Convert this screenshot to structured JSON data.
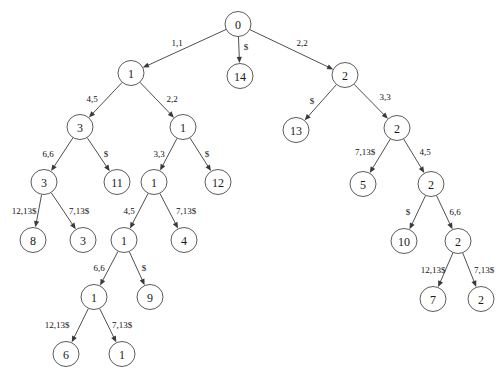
{
  "diagram": {
    "node_radius": 13,
    "colors": {
      "stroke": "#4a4a4a",
      "edge": "#3a3a3a",
      "text": "#1a1a1a",
      "background": "#ffffff"
    },
    "nodes": [
      {
        "id": "n0",
        "label": "0",
        "x": 238,
        "y": 24
      },
      {
        "id": "n1",
        "label": "14",
        "x": 240,
        "y": 76
      },
      {
        "id": "n2",
        "label": "1",
        "x": 131,
        "y": 73
      },
      {
        "id": "n3",
        "label": "2",
        "x": 345,
        "y": 75
      },
      {
        "id": "n4",
        "label": "3",
        "x": 80,
        "y": 127
      },
      {
        "id": "n5",
        "label": "1",
        "x": 183,
        "y": 127
      },
      {
        "id": "n6",
        "label": "13",
        "x": 296,
        "y": 130
      },
      {
        "id": "n7",
        "label": "2",
        "x": 397,
        "y": 128
      },
      {
        "id": "n8",
        "label": "3",
        "x": 44,
        "y": 182
      },
      {
        "id": "n9",
        "label": "11",
        "x": 117,
        "y": 182
      },
      {
        "id": "n10",
        "label": "1",
        "x": 154,
        "y": 182
      },
      {
        "id": "n11",
        "label": "12",
        "x": 218,
        "y": 182
      },
      {
        "id": "n12",
        "label": "5",
        "x": 363,
        "y": 184
      },
      {
        "id": "n13",
        "label": "2",
        "x": 431,
        "y": 184
      },
      {
        "id": "n14",
        "label": "8",
        "x": 33,
        "y": 240
      },
      {
        "id": "n15",
        "label": "3",
        "x": 83,
        "y": 240
      },
      {
        "id": "n16",
        "label": "1",
        "x": 124,
        "y": 240
      },
      {
        "id": "n17",
        "label": "4",
        "x": 184,
        "y": 240
      },
      {
        "id": "n18",
        "label": "10",
        "x": 404,
        "y": 241
      },
      {
        "id": "n19",
        "label": "2",
        "x": 458,
        "y": 241
      },
      {
        "id": "n20",
        "label": "1",
        "x": 94,
        "y": 297
      },
      {
        "id": "n21",
        "label": "9",
        "x": 150,
        "y": 297
      },
      {
        "id": "n22",
        "label": "7",
        "x": 433,
        "y": 299
      },
      {
        "id": "n23",
        "label": "2",
        "x": 481,
        "y": 299
      },
      {
        "id": "n24",
        "label": "6",
        "x": 66,
        "y": 354
      },
      {
        "id": "n25",
        "label": "1",
        "x": 122,
        "y": 354
      }
    ],
    "edges": [
      {
        "from": "n0",
        "to": "n2",
        "label": "1,1",
        "lx": 177,
        "ly": 43
      },
      {
        "from": "n0",
        "to": "n1",
        "label": "$",
        "lx": 246,
        "ly": 47
      },
      {
        "from": "n0",
        "to": "n3",
        "label": "2,2",
        "lx": 302,
        "ly": 43
      },
      {
        "from": "n2",
        "to": "n4",
        "label": "4,5",
        "lx": 92,
        "ly": 99
      },
      {
        "from": "n2",
        "to": "n5",
        "label": "2,2",
        "lx": 172,
        "ly": 99
      },
      {
        "from": "n3",
        "to": "n6",
        "label": "$",
        "lx": 312,
        "ly": 101
      },
      {
        "from": "n3",
        "to": "n7",
        "label": "3,3",
        "lx": 385,
        "ly": 97
      },
      {
        "from": "n4",
        "to": "n8",
        "label": "6,6",
        "lx": 48,
        "ly": 154
      },
      {
        "from": "n4",
        "to": "n9",
        "label": "$",
        "lx": 106,
        "ly": 154
      },
      {
        "from": "n5",
        "to": "n10",
        "label": "3,3",
        "lx": 159,
        "ly": 154
      },
      {
        "from": "n5",
        "to": "n11",
        "label": "$",
        "lx": 207,
        "ly": 154
      },
      {
        "from": "n7",
        "to": "n12",
        "label": "7,13$",
        "lx": 365,
        "ly": 152
      },
      {
        "from": "n7",
        "to": "n13",
        "label": "4,5",
        "lx": 425,
        "ly": 152
      },
      {
        "from": "n8",
        "to": "n14",
        "label": "12,13$",
        "lx": 24,
        "ly": 211
      },
      {
        "from": "n8",
        "to": "n15",
        "label": "7,13$",
        "lx": 79,
        "ly": 211
      },
      {
        "from": "n10",
        "to": "n16",
        "label": "4,5",
        "lx": 129,
        "ly": 211
      },
      {
        "from": "n10",
        "to": "n17",
        "label": "7,13$",
        "lx": 186,
        "ly": 211
      },
      {
        "from": "n13",
        "to": "n18",
        "label": "$",
        "lx": 408,
        "ly": 212
      },
      {
        "from": "n13",
        "to": "n19",
        "label": "6,6",
        "lx": 455,
        "ly": 212
      },
      {
        "from": "n16",
        "to": "n20",
        "label": "6,6",
        "lx": 99,
        "ly": 268
      },
      {
        "from": "n16",
        "to": "n21",
        "label": "$",
        "lx": 144,
        "ly": 268
      },
      {
        "from": "n19",
        "to": "n22",
        "label": "12,13$",
        "lx": 433,
        "ly": 270
      },
      {
        "from": "n19",
        "to": "n23",
        "label": "7,13$",
        "lx": 484,
        "ly": 270
      },
      {
        "from": "n20",
        "to": "n24",
        "label": "12,13$",
        "lx": 57,
        "ly": 325
      },
      {
        "from": "n20",
        "to": "n25",
        "label": "7,13$",
        "lx": 122,
        "ly": 325
      }
    ]
  }
}
